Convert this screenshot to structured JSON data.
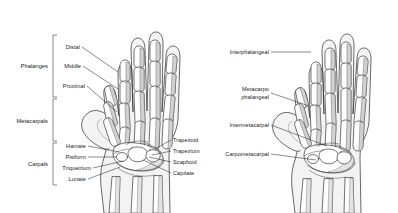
{
  "figure": {
    "background_color": "#ffffff",
    "label_color": "#1a1a1a",
    "leader_color": "#2b2b2b",
    "bracket_color": "#6b6b6b",
    "bone_fill": "#ffffff",
    "bone_outline": "#1d1d1d",
    "bone_shade": "#d2d2d2",
    "skin_fill": "#f3f3f3"
  },
  "left_hand": {
    "caption": "Bones of the hand",
    "groups": [
      {
        "name": "Phalanges",
        "label": "Phalanges"
      },
      {
        "name": "Metacarpals",
        "label": "Metacarpals"
      },
      {
        "name": "Carpals",
        "label": "Carpals"
      }
    ],
    "phalanx_labels": [
      {
        "name": "distal",
        "label": "Distal"
      },
      {
        "name": "middle",
        "label": "Middle"
      },
      {
        "name": "proximal",
        "label": "Proximal"
      }
    ],
    "carpal_labels_left": [
      {
        "name": "hamate",
        "label": "Hamate"
      },
      {
        "name": "pisiform",
        "label": "Pisiform"
      },
      {
        "name": "triquetrium",
        "label": "Triquetrium"
      },
      {
        "name": "lunate",
        "label": "Lunate"
      }
    ],
    "carpal_labels_right": [
      {
        "name": "trapezoid",
        "label": "Trapezoid"
      },
      {
        "name": "trapezium",
        "label": "Trapezium"
      },
      {
        "name": "scaphoid",
        "label": "Scaphoid"
      },
      {
        "name": "capitate",
        "label": "Capitate"
      }
    ]
  },
  "right_hand": {
    "caption": "Joints of the hand",
    "joint_labels": [
      {
        "name": "interphalangeal",
        "label": "Interphalangeal",
        "line2": ""
      },
      {
        "name": "metacarpophalangeal",
        "label": "Metacarpo",
        "line2": "phalangeal"
      },
      {
        "name": "intermetacarpal",
        "label": "Intermetacarpal",
        "line2": ""
      },
      {
        "name": "carpometacarpal",
        "label": "Carpometacarpal",
        "line2": ""
      }
    ]
  }
}
